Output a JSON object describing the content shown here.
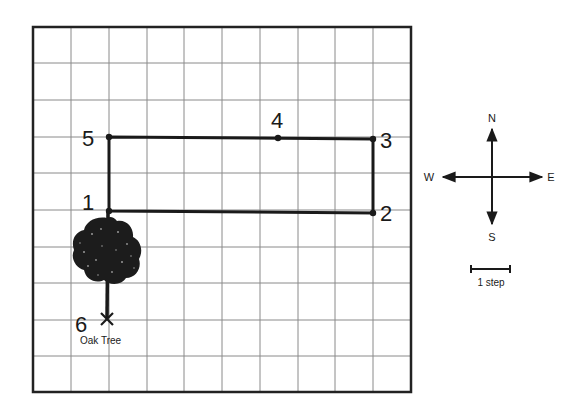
{
  "diagram": {
    "grid": {
      "columns": 10,
      "rows": 10,
      "left": 33,
      "top": 27,
      "right": 411,
      "bottom": 392
    },
    "points": [
      {
        "label": "1",
        "x": 109,
        "y": 211
      },
      {
        "label": "2",
        "x": 373,
        "y": 213
      },
      {
        "label": "3",
        "x": 373,
        "y": 139
      },
      {
        "label": "4",
        "x": 278,
        "y": 138
      },
      {
        "label": "5",
        "x": 109,
        "y": 137
      },
      {
        "label": "6",
        "x": 107,
        "y": 319
      }
    ],
    "landmark": {
      "label": "Oak Tree",
      "icon": "tree-icon"
    },
    "compass": {
      "north": "N",
      "south": "S",
      "west": "W",
      "east": "E"
    },
    "scale": {
      "label": "1 step"
    },
    "colors": {
      "line": "#1a1a1a",
      "grid": "#7a7a7a",
      "background": "#ffffff"
    }
  }
}
